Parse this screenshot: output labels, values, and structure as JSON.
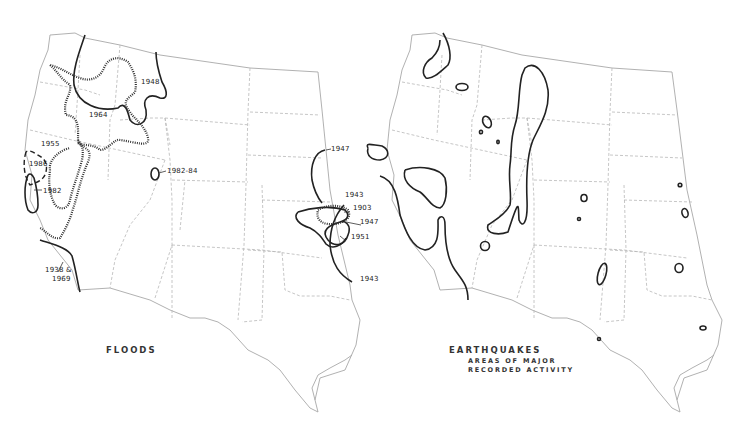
{
  "maps": {
    "floods": {
      "title": "FLOODS",
      "labels": {
        "y1948": "1948",
        "y1964": "1964",
        "y1955": "1955",
        "y1986": "1986",
        "y1982": "1982",
        "y1982_84": "1982-84",
        "y1938_1969_a": "1938  &",
        "y1938_1969_b": "1969",
        "y1947_top": "1947",
        "y1943_top": "1943",
        "y1903": "1903",
        "y1947_mid": "1947",
        "y1951": "1951",
        "y1943_bottom": "1943"
      }
    },
    "earthquakes": {
      "title": "EARTHQUAKES",
      "subtitle_line1": "AREAS OF MAJOR",
      "subtitle_line2": "RECORDED ACTIVITY"
    }
  }
}
